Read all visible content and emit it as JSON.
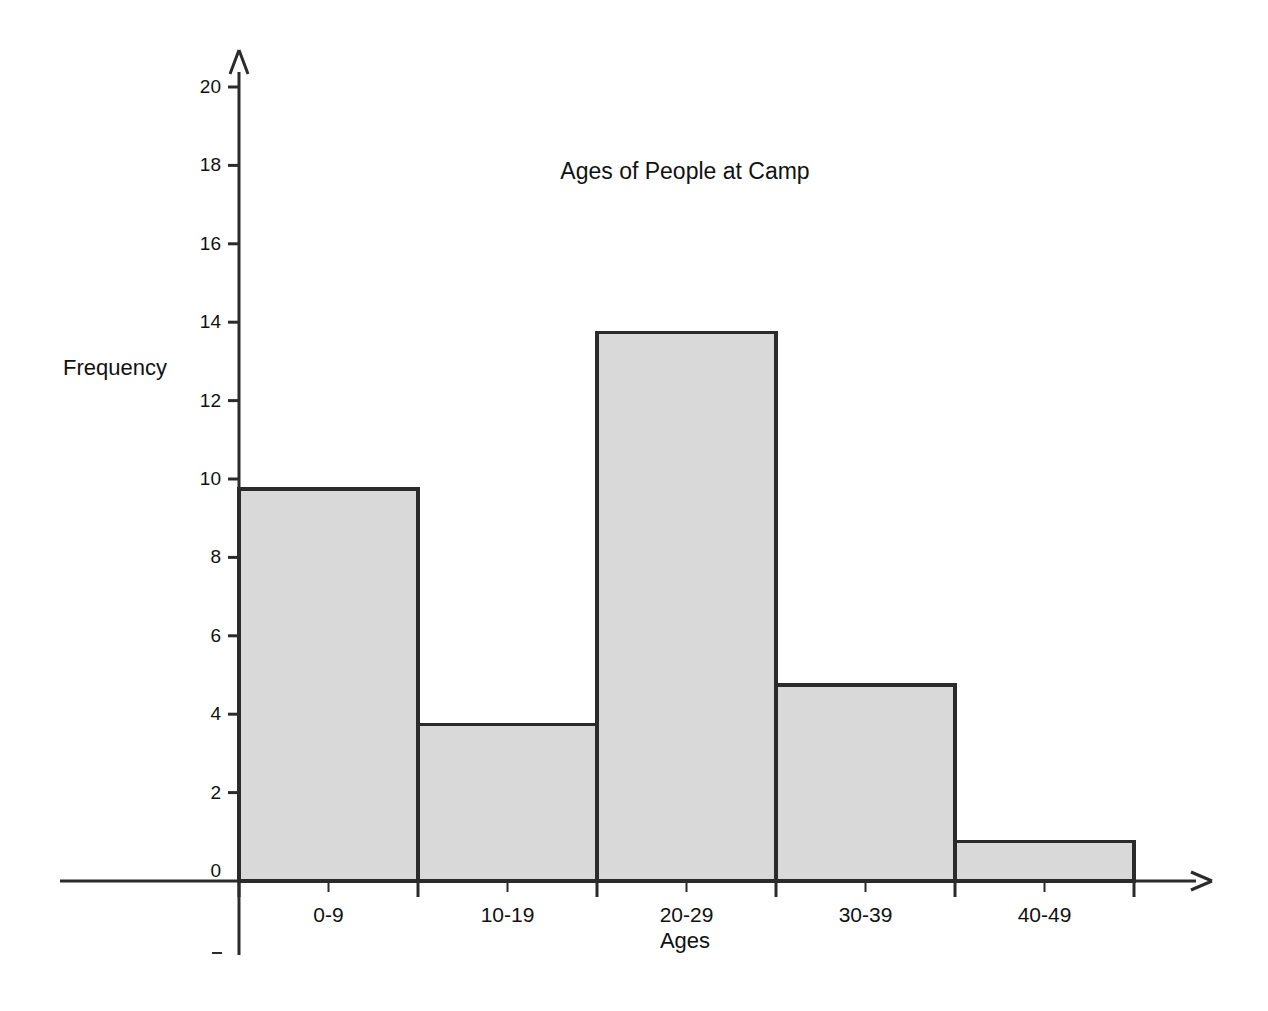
{
  "chart_data": {
    "type": "bar",
    "title": "Ages of People at Camp",
    "xlabel": "Ages",
    "ylabel": "Frequency",
    "categories": [
      "0-9",
      "10-19",
      "20-29",
      "30-39",
      "40-49"
    ],
    "values": [
      10,
      4,
      14,
      5,
      1
    ],
    "ylim": [
      0,
      20
    ],
    "ytick_labels": [
      "0",
      "2",
      "4",
      "6",
      "8",
      "10",
      "12",
      "14",
      "16",
      "18",
      "20"
    ],
    "ytick_values": [
      0,
      2,
      4,
      6,
      8,
      10,
      12,
      14,
      16,
      18,
      20
    ],
    "grid": false,
    "legend": "none",
    "bar_fill_color": "#d9d9d9",
    "bar_edge_color": "#2b2b2b",
    "axis_color": "#2b2b2b",
    "background_color": "#ffffff",
    "axis_style": "arrowed-axes"
  },
  "yticks": [
    {
      "label": "0",
      "value": 0
    },
    {
      "label": "2",
      "value": 2
    },
    {
      "label": "4",
      "value": 4
    },
    {
      "label": "6",
      "value": 6
    },
    {
      "label": "8",
      "value": 8
    },
    {
      "label": "10",
      "value": 10
    },
    {
      "label": "12",
      "value": 12
    },
    {
      "label": "14",
      "value": 14
    },
    {
      "label": "16",
      "value": 16
    },
    {
      "label": "18",
      "value": 18
    },
    {
      "label": "20",
      "value": 20
    }
  ],
  "bars": [
    {
      "label": "0-9",
      "value": 10
    },
    {
      "label": "10-19",
      "value": 4
    },
    {
      "label": "20-29",
      "value": 14
    },
    {
      "label": "30-39",
      "value": 5
    },
    {
      "label": "40-49",
      "value": 1
    }
  ]
}
